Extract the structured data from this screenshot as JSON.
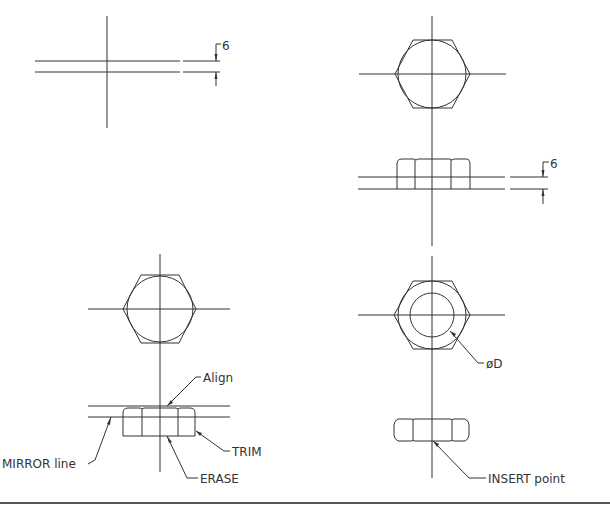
{
  "diagram": {
    "type": "cad-drafting-steps",
    "colors": {
      "stroke": "#333333",
      "background": "#ffffff",
      "border": "#555555"
    },
    "panels": [
      {
        "id": "step1",
        "position": "top-left",
        "dimension_text": "6"
      },
      {
        "id": "step2",
        "position": "top-right",
        "dimension_text": "6"
      },
      {
        "id": "step3",
        "position": "bottom-left",
        "labels": {
          "align": "Align",
          "mirror": "MIRROR line",
          "erase": "ERASE",
          "trim": "TRIM"
        }
      },
      {
        "id": "step4",
        "position": "bottom-right",
        "labels": {
          "diameter": "øD",
          "insert": "INSERT point"
        }
      }
    ]
  }
}
